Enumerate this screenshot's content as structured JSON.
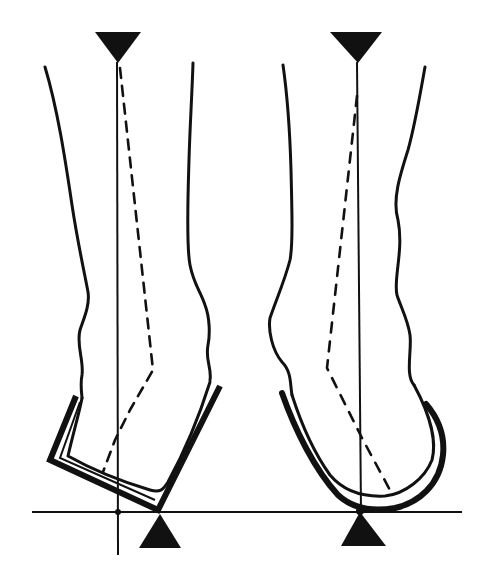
{
  "figure": {
    "colors": {
      "ink": "#111111",
      "background": "#ffffff"
    },
    "panels": [
      {
        "id": "left",
        "label": "",
        "heel_cup": "angular (bracket-shaped), tilted",
        "vertical_axis_x": 118,
        "load_marker_x": 160,
        "top_marker_x": 118
      },
      {
        "id": "right",
        "label": "",
        "heel_cup": "rounded (U-shaped)",
        "vertical_axis_x": 358,
        "load_marker_x": 358,
        "top_marker_x": 358
      }
    ],
    "ground_line_y": 512
  }
}
